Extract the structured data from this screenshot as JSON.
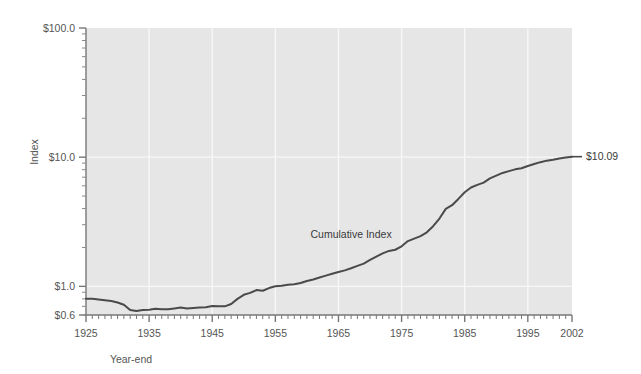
{
  "chart_data": {
    "type": "line",
    "title": "",
    "subtitle": "",
    "xlabel": "Year-end",
    "ylabel": "Index",
    "yscale": "log",
    "ylim": [
      0.6,
      100.0
    ],
    "xlim": [
      1925,
      2002
    ],
    "grid": true,
    "legend": false,
    "y_tick_labels": [
      "$100.0",
      "$10.0",
      "$1.0",
      "$0.6"
    ],
    "y_tick_values": [
      100.0,
      10.0,
      1.0,
      0.6
    ],
    "x_tick_labels": [
      "1925",
      "1935",
      "1945",
      "1955",
      "1965",
      "1975",
      "1985",
      "1995",
      "2002"
    ],
    "x_tick_values": [
      1925,
      1935,
      1945,
      1955,
      1965,
      1975,
      1985,
      1995,
      2002
    ],
    "annotations": [
      {
        "text": "Cumulative Index",
        "x": 1967,
        "y": 2.35
      },
      {
        "text": "$10.09",
        "x": 2002,
        "y": 10.09
      }
    ],
    "series": [
      {
        "name": "Cumulative Index",
        "color": "#4a4a4a",
        "x": [
          1925,
          1926,
          1927,
          1928,
          1929,
          1930,
          1931,
          1932,
          1933,
          1934,
          1935,
          1936,
          1937,
          1938,
          1939,
          1940,
          1941,
          1942,
          1943,
          1944,
          1945,
          1946,
          1947,
          1948,
          1949,
          1950,
          1951,
          1952,
          1953,
          1954,
          1955,
          1956,
          1957,
          1958,
          1959,
          1960,
          1961,
          1962,
          1963,
          1964,
          1965,
          1966,
          1967,
          1968,
          1969,
          1970,
          1971,
          1972,
          1973,
          1974,
          1975,
          1976,
          1977,
          1978,
          1979,
          1980,
          1981,
          1982,
          1983,
          1984,
          1985,
          1986,
          1987,
          1988,
          1989,
          1990,
          1991,
          1992,
          1993,
          1994,
          1995,
          1996,
          1997,
          1998,
          1999,
          2000,
          2001,
          2002
        ],
        "y": [
          0.8,
          0.8,
          0.79,
          0.78,
          0.77,
          0.75,
          0.72,
          0.655,
          0.645,
          0.655,
          0.66,
          0.67,
          0.665,
          0.665,
          0.675,
          0.685,
          0.675,
          0.68,
          0.685,
          0.69,
          0.705,
          0.7,
          0.7,
          0.73,
          0.8,
          0.86,
          0.89,
          0.935,
          0.925,
          0.97,
          1.0,
          1.01,
          1.03,
          1.04,
          1.06,
          1.1,
          1.13,
          1.17,
          1.21,
          1.25,
          1.29,
          1.33,
          1.38,
          1.44,
          1.5,
          1.6,
          1.7,
          1.8,
          1.88,
          1.92,
          2.04,
          2.24,
          2.34,
          2.45,
          2.62,
          2.92,
          3.35,
          3.98,
          4.25,
          4.75,
          5.35,
          5.82,
          6.1,
          6.35,
          6.85,
          7.2,
          7.55,
          7.8,
          8.05,
          8.2,
          8.55,
          8.85,
          9.15,
          9.4,
          9.55,
          9.75,
          9.95,
          10.09
        ]
      }
    ]
  },
  "axes": {
    "y_axis_title": "Index",
    "x_axis_title": "Year-end"
  }
}
